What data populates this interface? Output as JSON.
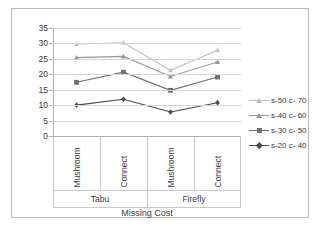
{
  "chart_data": {
    "type": "line",
    "title": "",
    "xlabel": "Missing Cost",
    "ylabel": "",
    "ylim": [
      0,
      35
    ],
    "ytick_step": 5,
    "yticks": [
      35,
      30,
      25,
      20,
      15,
      10,
      5,
      0
    ],
    "grid": true,
    "legend_position": "right",
    "categories": [
      "Mushroom",
      "Connect",
      "Mushroom",
      "Connect"
    ],
    "groups": [
      {
        "label": "Tabu",
        "span": 2
      },
      {
        "label": "Firefly",
        "span": 2
      }
    ],
    "series": [
      {
        "name": "s-50 c- 70",
        "color": "#bfbfbf",
        "marker": "triangle",
        "values": [
          29.8,
          30.2,
          21.3,
          27.8
        ]
      },
      {
        "name": "s-40 c- 60",
        "color": "#989898",
        "marker": "triangle",
        "values": [
          25.4,
          25.8,
          19.3,
          24.0
        ]
      },
      {
        "name": "s-30 c- 50",
        "color": "#6e6e6e",
        "marker": "square",
        "values": [
          17.4,
          20.7,
          14.8,
          19.1
        ]
      },
      {
        "name": "s-20 c- 40",
        "color": "#4a4a4a",
        "marker": "diamond",
        "values": [
          10.0,
          11.9,
          7.8,
          10.8
        ]
      }
    ]
  },
  "colors": {
    "frame_border": "#b8b8b8",
    "gridline": "#d6d6d6",
    "axis": "#b0b0b0",
    "text": "#3a3a3a",
    "background": "#ffffff"
  }
}
